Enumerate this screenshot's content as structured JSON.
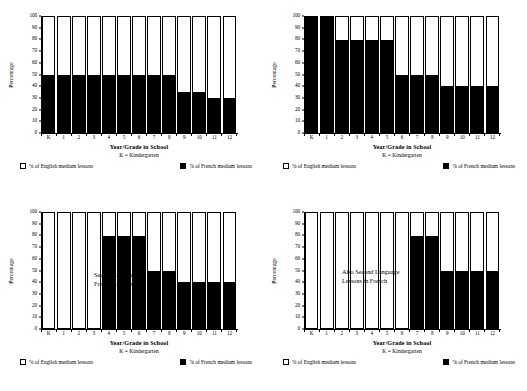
{
  "figure": {
    "axis": {
      "ylabel": "Percentage",
      "xlabel": "Year/Grade in School",
      "xsublabel": "K = Kindergarten",
      "yticks": [
        "0",
        "10",
        "20",
        "30",
        "40",
        "50",
        "60",
        "70",
        "80",
        "90",
        "100"
      ],
      "xticks": [
        "K",
        "1",
        "2",
        "3",
        "4",
        "5",
        "6",
        "7",
        "8",
        "9",
        "10",
        "11",
        "12"
      ]
    },
    "legend": {
      "english_label": "% of English medium lessons",
      "french_label": "% of French medium lessons",
      "english_color": "#ffffff",
      "french_color": "#000000"
    }
  },
  "chart_data": [
    {
      "type": "bar",
      "panel": "top-left",
      "title": "",
      "xlabel": "Year/Grade in School",
      "ylabel": "Percentage",
      "ylim": [
        0,
        100
      ],
      "grid": false,
      "legend_position": "bottom",
      "categories": [
        "K",
        "1",
        "2",
        "3",
        "4",
        "5",
        "6",
        "7",
        "8",
        "9",
        "10",
        "11",
        "12"
      ],
      "series": [
        {
          "name": "% of French medium lessons",
          "values": [
            50,
            50,
            50,
            50,
            50,
            50,
            50,
            50,
            50,
            35,
            35,
            30,
            30
          ]
        },
        {
          "name": "% of English medium lessons",
          "values": [
            50,
            50,
            50,
            50,
            50,
            50,
            50,
            50,
            50,
            65,
            65,
            70,
            70
          ]
        }
      ],
      "annotation": ""
    },
    {
      "type": "bar",
      "panel": "top-right",
      "title": "",
      "xlabel": "Year/Grade in School",
      "ylabel": "Percentage",
      "ylim": [
        0,
        100
      ],
      "grid": false,
      "legend_position": "bottom",
      "categories": [
        "K",
        "1",
        "2",
        "3",
        "4",
        "5",
        "6",
        "7",
        "8",
        "9",
        "10",
        "11",
        "12"
      ],
      "series": [
        {
          "name": "% of French medium lessons",
          "values": [
            100,
            100,
            80,
            80,
            80,
            80,
            50,
            50,
            50,
            40,
            40,
            40,
            40
          ]
        },
        {
          "name": "% of English medium lessons",
          "values": [
            0,
            0,
            20,
            20,
            20,
            20,
            50,
            50,
            50,
            60,
            60,
            60,
            60
          ]
        }
      ],
      "annotation": ""
    },
    {
      "type": "bar",
      "panel": "bottom-left",
      "title": "",
      "xlabel": "Year/Grade in School",
      "ylabel": "Percentage",
      "ylim": [
        0,
        100
      ],
      "grid": false,
      "legend_position": "bottom",
      "categories": [
        "K",
        "1",
        "2",
        "3",
        "4",
        "5",
        "6",
        "7",
        "8",
        "9",
        "10",
        "11",
        "12"
      ],
      "series": [
        {
          "name": "% of French medium lessons",
          "values": [
            0,
            0,
            0,
            0,
            80,
            80,
            80,
            50,
            50,
            40,
            40,
            40,
            40
          ]
        },
        {
          "name": "% of English medium lessons",
          "values": [
            100,
            100,
            100,
            100,
            20,
            20,
            20,
            50,
            50,
            60,
            60,
            60,
            60
          ]
        }
      ],
      "annotation": "Second Language\nFrench Lessons"
    },
    {
      "type": "bar",
      "panel": "bottom-right",
      "title": "",
      "xlabel": "Year/Grade in School",
      "ylabel": "Percentage",
      "ylim": [
        0,
        100
      ],
      "grid": false,
      "legend_position": "bottom",
      "categories": [
        "K",
        "1",
        "2",
        "3",
        "4",
        "5",
        "6",
        "7",
        "8",
        "9",
        "10",
        "11",
        "12"
      ],
      "series": [
        {
          "name": "% of French medium lessons",
          "values": [
            0,
            0,
            0,
            0,
            0,
            0,
            0,
            80,
            80,
            50,
            50,
            50,
            50
          ]
        },
        {
          "name": "% of English medium lessons",
          "values": [
            100,
            100,
            100,
            100,
            100,
            100,
            100,
            20,
            20,
            50,
            50,
            50,
            50
          ]
        }
      ],
      "annotation": "Also Second Language\nLessons in French"
    }
  ]
}
